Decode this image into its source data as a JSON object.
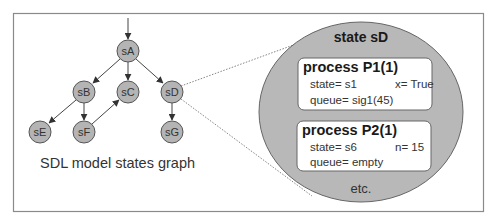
{
  "graph": {
    "caption": "SDL model states graph",
    "nodes": [
      {
        "id": "sA",
        "label": "sA",
        "x": 128,
        "y": 51
      },
      {
        "id": "sB",
        "label": "sB",
        "x": 84,
        "y": 92
      },
      {
        "id": "sC",
        "label": "sC",
        "x": 128,
        "y": 92
      },
      {
        "id": "sD",
        "label": "sD",
        "x": 172,
        "y": 92
      },
      {
        "id": "sE",
        "label": "sE",
        "x": 40,
        "y": 132
      },
      {
        "id": "sF",
        "label": "sF",
        "x": 84,
        "y": 132
      },
      {
        "id": "sG",
        "label": "sG",
        "x": 172,
        "y": 132
      }
    ],
    "edges": [
      {
        "from": "start",
        "to": "sA"
      },
      {
        "from": "sA",
        "to": "sB"
      },
      {
        "from": "sA",
        "to": "sC"
      },
      {
        "from": "sA",
        "to": "sD"
      },
      {
        "from": "sB",
        "to": "sE"
      },
      {
        "from": "sB",
        "to": "sF"
      },
      {
        "from": "sF",
        "to": "sC"
      },
      {
        "from": "sD",
        "to": "sG"
      }
    ]
  },
  "detail": {
    "title": "state sD",
    "processes": [
      {
        "title": "process P1(1)",
        "state": "state= s1",
        "var": "x= True",
        "queue": "queue= sig1(45)"
      },
      {
        "title": "process P2(1)",
        "state": "state= s6",
        "var": "n= 15",
        "queue": "queue= empty"
      }
    ],
    "footer": "etc."
  },
  "colors": {
    "node_fill": "#b4b4b4",
    "ellipse_fill": "#b8b8b8",
    "stroke": "#555555",
    "frame": "#8a8a8a"
  }
}
